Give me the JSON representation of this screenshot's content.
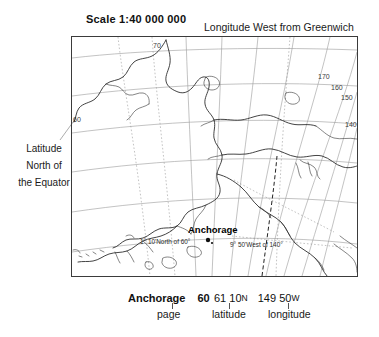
{
  "header": {
    "scale_title": "Scale 1:40 000 000",
    "greenwich_note": "Longitude West from Greenwich"
  },
  "left_annotation": {
    "line1": "Latitude",
    "line2": "North of",
    "line3": "the Equator"
  },
  "map": {
    "city_label": "Anchorage",
    "latitude_annotation": "1° 10'North of 60°",
    "longitude_annotation": "9° 50'West of 140°",
    "meridian_labels": [
      "170",
      "160",
      "150",
      "140"
    ],
    "parallel_labels": [
      "70",
      "60"
    ],
    "frame_color": "#3b3b3b",
    "graticule_color": "#9a9a9a",
    "coast_color": "#222222"
  },
  "caption": {
    "name": "Anchorage",
    "page_number": "60",
    "latitude_deg": "61",
    "latitude_min": "10",
    "latitude_hemi": "N",
    "longitude_deg": "149",
    "longitude_min": "50",
    "longitude_hemi": "W",
    "label_page": "page",
    "label_latitude": "latitude",
    "label_longitude": "longitude"
  }
}
